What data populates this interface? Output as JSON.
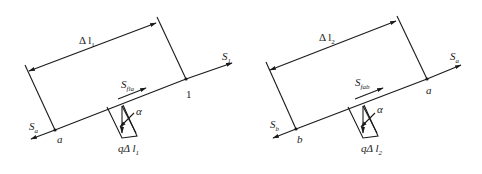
{
  "diagrams": [
    {
      "id": "left",
      "length_label": "Δ l",
      "length_sub": "1",
      "end_force": "S",
      "end_force_sub": "1",
      "start_force": "S",
      "start_force_sub": "a",
      "friction_force": "S",
      "friction_force_sub": "fla",
      "start_point": "a",
      "end_point": "1",
      "angle": "α",
      "load_label": "qΔ l",
      "load_sub": "1"
    },
    {
      "id": "right",
      "length_label": "Δ l",
      "length_sub": "2",
      "end_force": "S",
      "end_force_sub": "a",
      "start_force": "S",
      "start_force_sub": "b",
      "friction_force": "S",
      "friction_force_sub": "fab",
      "start_point": "b",
      "end_point": "a",
      "angle": "α",
      "load_label": "qΔ l",
      "load_sub": "2"
    }
  ],
  "colors": {
    "stroke": "#1a1a1a",
    "background": "#ffffff"
  }
}
